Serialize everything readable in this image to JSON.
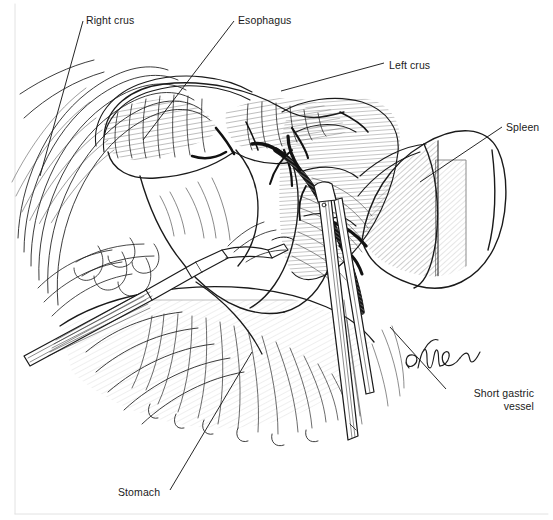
{
  "figure": {
    "style": "black-and-white pen-and-ink line drawing",
    "background_color": "#ffffff",
    "ink_color": "#1a1a1a",
    "width": 553,
    "height": 520
  },
  "labels": [
    {
      "id": "right-crus",
      "text": "Right crus",
      "x": 86,
      "y": 14,
      "align": "left",
      "leader": {
        "x1": 83,
        "y1": 21,
        "x2": 40,
        "y2": 176
      }
    },
    {
      "id": "esophagus",
      "text": "Esophagus",
      "x": 238,
      "y": 14,
      "align": "left",
      "leader": {
        "x1": 234,
        "y1": 21,
        "x2": 143,
        "y2": 140
      }
    },
    {
      "id": "left-crus",
      "text": "Left crus",
      "x": 389,
      "y": 59,
      "align": "left",
      "leader": {
        "x1": 384,
        "y1": 63,
        "x2": 281,
        "y2": 91
      }
    },
    {
      "id": "spleen",
      "text": "Spleen",
      "x": 506,
      "y": 121,
      "align": "left",
      "leader": {
        "x1": 502,
        "y1": 127,
        "x2": 420,
        "y2": 182
      }
    },
    {
      "id": "short-gastric-vessel",
      "text": "Short gastric\nvessel",
      "x": 449,
      "y": 389,
      "align": "right",
      "width": 85,
      "leader": {
        "x1": 446,
        "y1": 389,
        "x2": 390,
        "y2": 327
      }
    },
    {
      "id": "stomach",
      "text": "Stomach",
      "x": 118,
      "y": 486,
      "align": "left",
      "leader": {
        "x1": 170,
        "y1": 490,
        "x2": 252,
        "y2": 352
      }
    }
  ],
  "signature": {
    "text": "GMueller",
    "x": 405,
    "y": 352
  },
  "anatomy": {
    "structures": [
      "right crus of diaphragm",
      "left crus of diaphragm",
      "distal esophagus with longitudinal muscle fibers",
      "gastric fundus",
      "spleen",
      "stomach body with rugal folds",
      "short gastric vessels",
      "surgical clip"
    ],
    "instruments": [
      "laparoscopic grasper entering from lower left",
      "laparoscopic clip applier entering from bottom center"
    ]
  }
}
